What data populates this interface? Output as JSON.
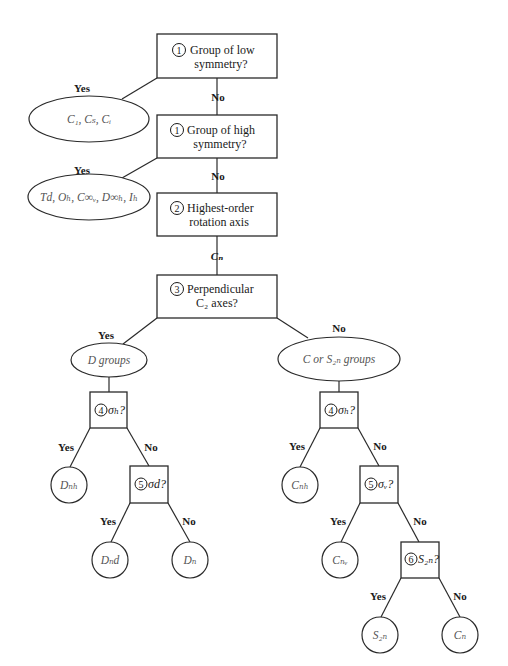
{
  "steps": {
    "low_symmetry": {
      "num": "1",
      "lines": [
        "Group of low",
        "symmetry?"
      ]
    },
    "high_symmetry": {
      "num": "1",
      "lines": [
        "Group of high",
        "symmetry?"
      ]
    },
    "rotation_axis": {
      "num": "2",
      "lines": [
        "Highest-order",
        "rotation axis"
      ]
    },
    "perp_c2": {
      "num": "3",
      "lines": [
        "Perpendicular",
        "C₂ axes?"
      ]
    },
    "d_sigma_h": {
      "num": "4",
      "text": "σₕ?"
    },
    "d_sigma_d": {
      "num": "5",
      "text": "σd?"
    },
    "c_sigma_h": {
      "num": "4",
      "text": "σₕ?"
    },
    "c_sigma_v": {
      "num": "5",
      "text": "σᵥ?"
    },
    "c_s2n": {
      "num": "6",
      "text": "S₂ₙ?"
    }
  },
  "results": {
    "low": "C₁, Cₛ, Cᵢ",
    "high": "Td, Oₕ, C∞ᵥ, D∞ₕ, Iₕ",
    "d_groups": "D groups",
    "c_groups": "C or S₂ₙ groups",
    "Dnh": "Dₙₕ",
    "Dnd": "Dₙd",
    "Dn": "Dₙ",
    "Cnh": "Cₙₕ",
    "Cnv": "Cₙᵥ",
    "S2n": "S₂ₙ",
    "Cn": "Cₙ"
  },
  "edge_labels": {
    "yes": "Yes",
    "no": "No",
    "cn": "Cₙ"
  }
}
